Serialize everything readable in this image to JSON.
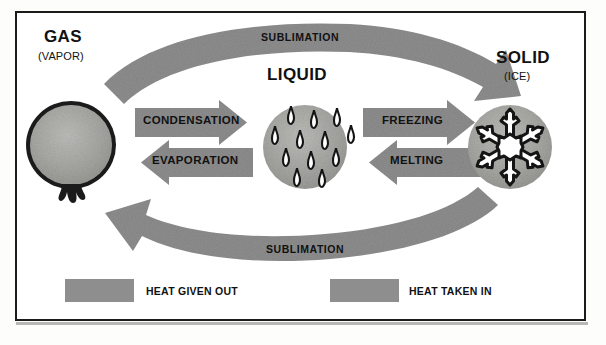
{
  "diagram": {
    "colors": {
      "arrow_gray": "#8e8e8e",
      "sphere_gray": "#a5a5a2",
      "outline_black": "#111111",
      "background": "#ffffff"
    },
    "states": [
      {
        "id": "gas",
        "title": "GAS",
        "subtitle": "(VAPOR)",
        "icon": "balloon-icon"
      },
      {
        "id": "liquid",
        "title": "LIQUID",
        "subtitle": "",
        "icon": "water-droplets-icon"
      },
      {
        "id": "solid",
        "title": "SOLID",
        "subtitle": "(ICE)",
        "icon": "snowflake-icon"
      }
    ],
    "transitions": [
      {
        "id": "condensation",
        "label": "CONDENSATION",
        "from": "gas",
        "to": "liquid",
        "direction": "right",
        "heat": "given-out"
      },
      {
        "id": "evaporation",
        "label": "EVAPORATION",
        "from": "liquid",
        "to": "gas",
        "direction": "left",
        "heat": "taken-in"
      },
      {
        "id": "freezing",
        "label": "FREEZING",
        "from": "liquid",
        "to": "solid",
        "direction": "right",
        "heat": "given-out"
      },
      {
        "id": "melting",
        "label": "MELTING",
        "from": "solid",
        "to": "liquid",
        "direction": "left",
        "heat": "taken-in"
      },
      {
        "id": "sublimation-top",
        "label": "SUBLIMATION",
        "from": "gas",
        "to": "solid",
        "direction": "right",
        "heat": "given-out"
      },
      {
        "id": "sublimation-bottom",
        "label": "SUBLIMATION",
        "from": "solid",
        "to": "gas",
        "direction": "left",
        "heat": "taken-in"
      }
    ],
    "legend": [
      {
        "id": "heat-given-out",
        "label": "HEAT GIVEN OUT",
        "swatch": "#8e8e8e"
      },
      {
        "id": "heat-taken-in",
        "label": "HEAT TAKEN IN",
        "swatch": "#8e8e8e"
      }
    ]
  }
}
